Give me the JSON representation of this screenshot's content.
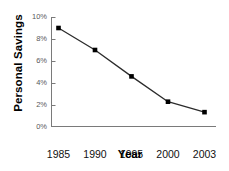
{
  "chart_data": {
    "type": "line",
    "title": "",
    "xlabel": "Year",
    "ylabel": "Personal Savings",
    "categories": [
      "1985",
      "1990",
      "1995",
      "2000",
      "2003"
    ],
    "values": [
      9.0,
      7.0,
      4.6,
      2.3,
      1.35
    ],
    "value_unit": "%",
    "ylim": [
      0,
      10
    ],
    "yticks": [
      "0%",
      "2%",
      "4%",
      "6%",
      "8%",
      "10%"
    ],
    "ytick_values": [
      0,
      2,
      4,
      6,
      8,
      10
    ],
    "grid": false,
    "legend": "none",
    "series": [
      {
        "name": "Personal Savings",
        "values": [
          9.0,
          7.0,
          4.6,
          2.3,
          1.35
        ],
        "marker": "filled-square",
        "color": "#000000"
      }
    ],
    "colors": {
      "line": "#2b2b2b",
      "marker": "#000000",
      "axis": "#7a7a7a",
      "tick_label": "#58585a",
      "axis_title": "#000000",
      "background": "#ffffff"
    }
  }
}
